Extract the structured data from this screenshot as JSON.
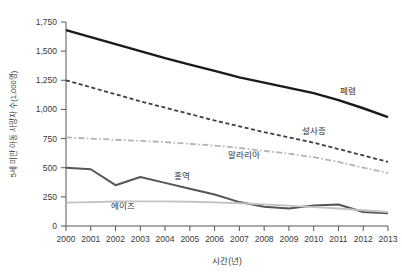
{
  "chart_data": {
    "type": "line",
    "title": "",
    "xlabel": "시간(년)",
    "ylabel": "5세 미만 아동 사망자 수(1,000명)",
    "x": [
      2000,
      2001,
      2002,
      2003,
      2004,
      2005,
      2006,
      2007,
      2008,
      2009,
      2010,
      2011,
      2012,
      2013
    ],
    "xtick_labels": [
      "2000",
      "2001",
      "2002",
      "2003",
      "2004",
      "2005",
      "2006",
      "2007",
      "2008",
      "2009",
      "2010",
      "2011",
      "2012",
      "2013"
    ],
    "ytick_labels": [
      "0",
      "250",
      "500",
      "750",
      "1,000",
      "1,250",
      "1,500",
      "1,750"
    ],
    "ytick_values": [
      0,
      250,
      500,
      750,
      1000,
      1250,
      1500,
      1750
    ],
    "ylim": [
      0,
      1750
    ],
    "xlim": [
      2000,
      2013
    ],
    "grid": false,
    "legend_position": "inline-annotations",
    "series": [
      {
        "name": "폐렴",
        "label": "폐렴",
        "color": "#1a1a1a",
        "style": "solid",
        "width": 2.4,
        "label_x": 2011.4,
        "label_y": 1130,
        "values": [
          1680,
          1620,
          1560,
          1500,
          1440,
          1385,
          1330,
          1275,
          1230,
          1185,
          1140,
          1080,
          1010,
          935
        ]
      },
      {
        "name": "설사증",
        "label": "설사증",
        "color": "#3d3d3d",
        "style": "dashed",
        "width": 1.8,
        "label_x": 2010.0,
        "label_y": 790,
        "values": [
          1250,
          1190,
          1130,
          1070,
          1015,
          960,
          905,
          855,
          805,
          760,
          715,
          660,
          605,
          550
        ]
      },
      {
        "name": "말라리아",
        "label": "말라리아",
        "color": "#b4b4b4",
        "style": "dashdot",
        "width": 1.8,
        "label_x": 2007.2,
        "label_y": 585,
        "values": [
          760,
          750,
          740,
          730,
          720,
          705,
          690,
          670,
          645,
          620,
          590,
          550,
          500,
          455
        ]
      },
      {
        "name": "홍역",
        "label": "홍역",
        "color": "#555555",
        "style": "solid",
        "width": 2.0,
        "label_x": 2004.7,
        "label_y": 400,
        "values": [
          500,
          487,
          350,
          420,
          370,
          320,
          270,
          205,
          165,
          150,
          175,
          185,
          120,
          110
        ]
      },
      {
        "name": "에이즈",
        "label": "에이즈",
        "color": "#c2c2c2",
        "style": "solid",
        "width": 1.8,
        "label_x": 2002.3,
        "label_y": 150,
        "values": [
          200,
          205,
          210,
          212,
          212,
          208,
          202,
          195,
          185,
          175,
          162,
          150,
          135,
          120
        ]
      }
    ]
  }
}
